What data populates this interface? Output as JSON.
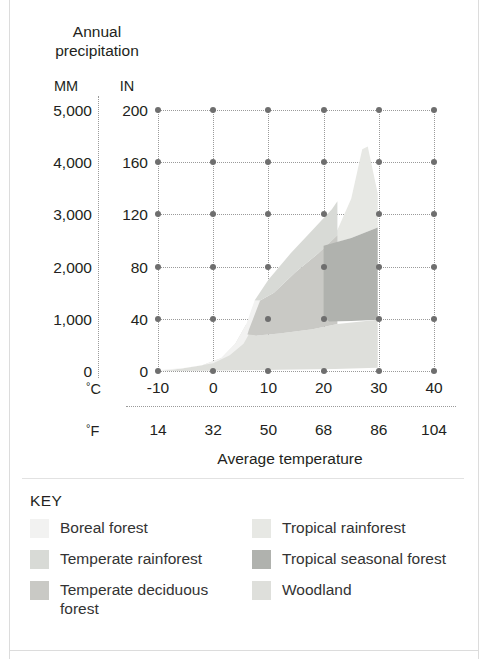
{
  "figure": {
    "y_axis_title": "Annual precipitation",
    "x_axis_title": "Average temperature",
    "unit_mm_header": "MM",
    "unit_in_header": "IN",
    "unit_c_label": "C",
    "unit_f_label": "F",
    "degree_symbol": "°"
  },
  "key": {
    "title": "KEY",
    "items": [
      {
        "label": "Boreal forest",
        "color": "#f2f2f1"
      },
      {
        "label": "Temperate rainforest",
        "color": "#d8dad6"
      },
      {
        "label": "Temperate deciduous forest",
        "color": "#c9c9c5"
      },
      {
        "label": "Tropical rainforest",
        "color": "#e7e8e4"
      },
      {
        "label": "Tropical seasonal forest",
        "color": "#b0b2ae"
      },
      {
        "label": "Woodland",
        "color": "#dedfdb"
      }
    ]
  },
  "chart_data": {
    "type": "area",
    "title": "Annual precipitation",
    "xlabel": "Average temperature",
    "ylabel": "Annual precipitation",
    "grid": true,
    "legend_position": "bottom",
    "x_axis": {
      "primary_unit": "°C",
      "secondary_unit": "°F",
      "xlim_c": [
        -10,
        40
      ],
      "ticks_c": [
        "-10",
        "0",
        "10",
        "20",
        "30",
        "40"
      ],
      "ticks_f": [
        "14",
        "32",
        "50",
        "68",
        "86",
        "104"
      ],
      "tick_values_c": [
        -10,
        0,
        10,
        20,
        30,
        40
      ],
      "tick_values_f": [
        14,
        32,
        50,
        68,
        86,
        104
      ]
    },
    "y_axis": {
      "primary_unit": "MM",
      "secondary_unit": "IN",
      "ylim_mm": [
        0,
        5000
      ],
      "ylim_in": [
        0,
        200
      ],
      "ticks_mm": [
        "5,000",
        "4,000",
        "3,000",
        "2,000",
        "1,000",
        "0"
      ],
      "ticks_in": [
        "200",
        "160",
        "120",
        "80",
        "40",
        "0"
      ],
      "tick_values_mm": [
        5000,
        4000,
        3000,
        2000,
        1000,
        0
      ],
      "tick_values_in": [
        200,
        160,
        120,
        80,
        40,
        0
      ]
    },
    "regions": [
      {
        "name": "Boreal forest",
        "color": "#f2f2f1",
        "temp_range_c": [
          -10,
          8
        ],
        "precip_range_mm": [
          0,
          950
        ],
        "polygon_c_mm": [
          [
            -9.5,
            20
          ],
          [
            -5,
            60
          ],
          [
            0,
            150
          ],
          [
            3,
            300
          ],
          [
            5.5,
            520
          ],
          [
            7.5,
            900
          ],
          [
            8.5,
            1350
          ],
          [
            7.5,
            1350
          ],
          [
            6,
            900
          ],
          [
            4,
            520
          ],
          [
            1.5,
            250
          ],
          [
            -2,
            110
          ],
          [
            -6,
            45
          ],
          [
            -9.5,
            5
          ]
        ]
      },
      {
        "name": "Temperate rainforest",
        "color": "#d8dad6",
        "temp_range_c": [
          7,
          22
        ],
        "precip_range_mm": [
          1300,
          3250
        ],
        "polygon_c_mm": [
          [
            7.5,
            1350
          ],
          [
            10,
            1750
          ],
          [
            14,
            2250
          ],
          [
            18,
            2700
          ],
          [
            21.5,
            3100
          ],
          [
            22.5,
            3250
          ],
          [
            22.5,
            2600
          ],
          [
            19,
            2250
          ],
          [
            15,
            1900
          ],
          [
            11,
            1500
          ],
          [
            8.5,
            1350
          ]
        ]
      },
      {
        "name": "Temperate deciduous forest",
        "color": "#c9c9c5",
        "temp_range_c": [
          6,
          22
        ],
        "precip_range_mm": [
          700,
          2650
        ],
        "polygon_c_mm": [
          [
            6.5,
            800
          ],
          [
            8.5,
            1350
          ],
          [
            11,
            1500
          ],
          [
            15,
            1900
          ],
          [
            19,
            2250
          ],
          [
            22.5,
            2600
          ],
          [
            22.5,
            900
          ],
          [
            18,
            800
          ],
          [
            12,
            720
          ],
          [
            8,
            680
          ],
          [
            6.2,
            700
          ]
        ]
      },
      {
        "name": "Tropical rainforest",
        "color": "#e7e8e4",
        "temp_range_c": [
          20,
          30
        ],
        "precip_range_mm": [
          2400,
          4300
        ],
        "polygon_c_mm": [
          [
            20,
            2400
          ],
          [
            22.5,
            2700
          ],
          [
            25,
            3300
          ],
          [
            27,
            4250
          ],
          [
            28,
            4300
          ],
          [
            29.8,
            3400
          ],
          [
            29.8,
            2750
          ],
          [
            25,
            2550
          ],
          [
            21,
            2420
          ]
        ]
      },
      {
        "name": "Tropical seasonal forest",
        "color": "#b0b2ae",
        "temp_range_c": [
          20,
          30
        ],
        "precip_range_mm": [
          950,
          2800
        ],
        "polygon_c_mm": [
          [
            20,
            2400
          ],
          [
            25,
            2550
          ],
          [
            29.8,
            2750
          ],
          [
            29.8,
            980
          ],
          [
            25,
            960
          ],
          [
            21,
            950
          ],
          [
            20,
            1050
          ]
        ]
      },
      {
        "name": "Woodland",
        "color": "#dedfdb",
        "temp_range_c": [
          -10,
          30
        ],
        "precip_range_mm": [
          0,
          1000
        ],
        "polygon_c_mm": [
          [
            -9.5,
            5
          ],
          [
            -6,
            45
          ],
          [
            -2,
            110
          ],
          [
            1.5,
            250
          ],
          [
            4,
            520
          ],
          [
            6,
            900
          ],
          [
            6.5,
            800
          ],
          [
            8,
            680
          ],
          [
            12,
            720
          ],
          [
            18,
            800
          ],
          [
            22.5,
            900
          ],
          [
            29.8,
            980
          ],
          [
            29.8,
            60
          ],
          [
            22,
            40
          ],
          [
            12,
            22
          ],
          [
            2,
            10
          ],
          [
            -6,
            2
          ]
        ]
      }
    ]
  }
}
